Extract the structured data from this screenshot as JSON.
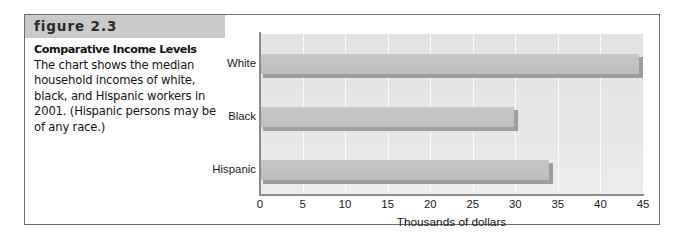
{
  "figure": {
    "banner_label": "figure 2.3",
    "caption_title": "Comparative Income Levels",
    "caption_body": "The chart shows the median household incomes of white, black, and Hispanic workers in 2001. (Hispanic persons may be of any race.)"
  },
  "colors": {
    "banner_bg": "#c9c9c9",
    "plot_bg": "#e4e4e4",
    "bar_fill": "#c2c2c2",
    "bar_shadow": "#9e9e9e",
    "axis": "#8c8c8c",
    "frame_border": "#6d6d6d"
  },
  "chart_data": {
    "type": "bar",
    "orientation": "horizontal",
    "title": "",
    "xlabel": "Thousands of dollars",
    "ylabel": "",
    "categories": [
      "White",
      "Black",
      "Hispanic"
    ],
    "values": [
      44.5,
      29.9,
      33.9
    ],
    "xlim": [
      0,
      45
    ],
    "xticks": [
      0,
      5,
      10,
      15,
      20,
      25,
      30,
      35,
      40,
      45
    ],
    "xtick_labels": [
      "0",
      "5",
      "10",
      "15",
      "20",
      "25",
      "30",
      "35",
      "40",
      "45"
    ],
    "grid": "vertical-white-gridlines",
    "legend": "none"
  }
}
